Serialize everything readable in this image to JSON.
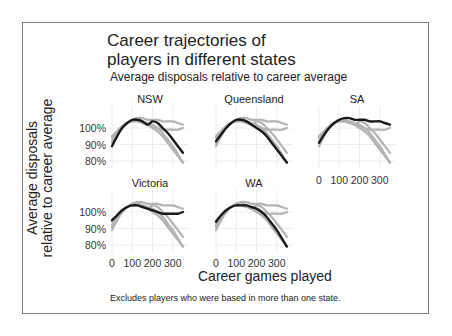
{
  "chart_data": {
    "type": "line",
    "title": "Career trajectories of players in different states",
    "subtitle": "Average disposals relative to career average",
    "xlabel": "Career games played",
    "ylabel": "Average disposals relative to career average",
    "note": "Excludes players who were based in more than one state.",
    "x_ticks": [
      0,
      100,
      200,
      300
    ],
    "y_ticks": [
      "80%",
      "90%",
      "100%"
    ],
    "xlim": [
      0,
      375
    ],
    "ylim": [
      0.75,
      1.08
    ],
    "grid": true,
    "layout": "facet_wrap 3 columns",
    "x": [
      0,
      25,
      50,
      75,
      100,
      125,
      150,
      175,
      200,
      225,
      250,
      275,
      300,
      325,
      350
    ],
    "panels": [
      {
        "name": "NSW",
        "highlight": [
          0.89,
          0.95,
          1.0,
          1.03,
          1.05,
          1.05,
          1.04,
          1.02,
          1.04,
          1.03,
          1.0,
          0.97,
          0.93,
          0.89,
          0.85
        ]
      },
      {
        "name": "Queensland",
        "highlight": [
          0.92,
          0.96,
          1.0,
          1.03,
          1.05,
          1.05,
          1.04,
          1.02,
          1.0,
          0.98,
          0.95,
          0.91,
          0.87,
          0.83,
          0.79
        ]
      },
      {
        "name": "SA",
        "highlight": [
          0.91,
          0.96,
          1.0,
          1.03,
          1.05,
          1.06,
          1.06,
          1.05,
          1.05,
          1.05,
          1.04,
          1.04,
          1.04,
          1.03,
          1.02
        ]
      },
      {
        "name": "Victoria",
        "highlight": [
          0.95,
          0.98,
          1.01,
          1.03,
          1.04,
          1.04,
          1.03,
          1.02,
          1.01,
          1.0,
          0.99,
          0.99,
          0.99,
          0.99,
          1.0
        ]
      },
      {
        "name": "WA",
        "highlight": [
          0.94,
          0.98,
          1.01,
          1.03,
          1.04,
          1.04,
          1.04,
          1.03,
          1.02,
          1.0,
          0.97,
          0.93,
          0.89,
          0.84,
          0.79
        ]
      }
    ],
    "colors": {
      "highlight": "#1a1a1a",
      "other": "#b3b3b3",
      "grid": "#ececec"
    }
  },
  "labels": {
    "title_line1": "Career trajectories of",
    "title_line2": "players in different states",
    "subtitle": "Average disposals relative to career average",
    "ylabel_line1": "Average disposals",
    "ylabel_line2": "relative to career average",
    "xlabel": "Career games played",
    "note": "Excludes players who were based in more than one state.",
    "panel_titles": [
      "NSW",
      "Queensland",
      "SA",
      "Victoria",
      "WA"
    ],
    "y_tick_labels": [
      "100%",
      "90%",
      "80%"
    ],
    "x_tick_labels": [
      "0",
      "100",
      "200",
      "300"
    ]
  }
}
